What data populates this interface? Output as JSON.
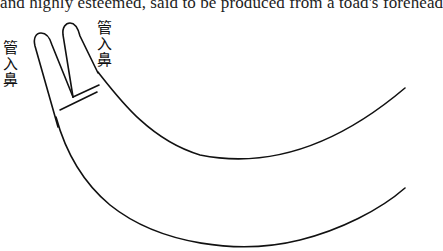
{
  "text_line": "and highly esteemed, said to be produced from a toad's forehead",
  "figure": {
    "label_left": [
      "管",
      "入",
      "鼻"
    ],
    "label_right": [
      "管",
      "入",
      "鼻"
    ]
  }
}
